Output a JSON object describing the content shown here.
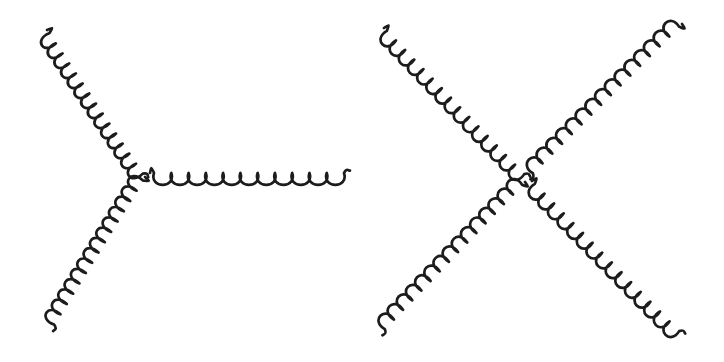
{
  "figure": {
    "background_color": "#ffffff",
    "line_color": "#1c1c1c",
    "width": 724,
    "height": 362,
    "stroke_width": 2.7
  },
  "panels": [
    {
      "id": "three-gluon",
      "name": "Three-gluon vertex",
      "vertex_label": "",
      "vertex": {
        "x": 145,
        "y": 177
      },
      "legs": [
        {
          "name": "upper-left-gluon-leg",
          "particle": "gluon",
          "from": {
            "x": 47,
            "y": 30
          },
          "to": {
            "x": 145,
            "y": 177
          },
          "coil_count": 14,
          "coil_radius": 10.5,
          "coil_side": "right"
        },
        {
          "name": "lower-left-gluon-leg",
          "particle": "gluon",
          "from": {
            "x": 145,
            "y": 177
          },
          "to": {
            "x": 52,
            "y": 328
          },
          "coil_count": 14,
          "coil_radius": 10.5,
          "coil_side": "right"
        },
        {
          "name": "right-horizontal-gluon-leg",
          "particle": "gluon",
          "from": {
            "x": 150,
            "y": 173
          },
          "to": {
            "x": 348,
            "y": 173
          },
          "coil_count": 11,
          "coil_radius": 9.8,
          "coil_side": "right"
        }
      ]
    },
    {
      "id": "four-gluon",
      "name": "Four-gluon vertex",
      "vertex_label": "",
      "vertex": {
        "x": 165,
        "y": 177
      },
      "legs": [
        {
          "name": "upper-left-gluon-leg",
          "particle": "gluon",
          "from": {
            "x": 22,
            "y": 28
          },
          "to": {
            "x": 165,
            "y": 177
          },
          "coil_count": 15,
          "coil_radius": 10.2,
          "coil_side": "right"
        },
        {
          "name": "upper-right-gluon-leg",
          "particle": "gluon",
          "from": {
            "x": 320,
            "y": 24
          },
          "to": {
            "x": 168,
            "y": 176
          },
          "coil_count": 15,
          "coil_radius": 10.2,
          "coil_side": "right"
        },
        {
          "name": "lower-left-gluon-leg",
          "particle": "gluon",
          "from": {
            "x": 163,
            "y": 182
          },
          "to": {
            "x": 20,
            "y": 332
          },
          "coil_count": 15,
          "coil_radius": 10.2,
          "coil_side": "right"
        },
        {
          "name": "lower-right-gluon-leg",
          "particle": "gluon",
          "from": {
            "x": 170,
            "y": 181
          },
          "to": {
            "x": 320,
            "y": 334
          },
          "coil_count": 15,
          "coil_radius": 10.2,
          "coil_side": "right"
        }
      ]
    }
  ]
}
